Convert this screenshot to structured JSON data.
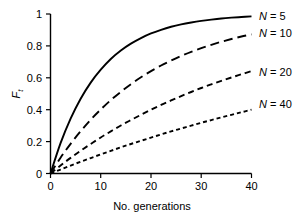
{
  "chart_data": {
    "type": "line",
    "title": "",
    "subtitle": "",
    "xlabel": "No. generations",
    "ylabel": "F",
    "ylabel_sub": "t",
    "ylabel_full": "F_t",
    "xlim": [
      0,
      40
    ],
    "ylim": [
      0,
      1
    ],
    "xticks": [
      0,
      10,
      20,
      30,
      40
    ],
    "xticklabels": [
      "0",
      "10",
      "20",
      "30",
      "40"
    ],
    "yticks": [
      0,
      0.2,
      0.4,
      0.6,
      0.8,
      1
    ],
    "yticklabels": [
      "0",
      "0.2",
      "0.4",
      "0.6",
      "0.8",
      "1"
    ],
    "grid": false,
    "legend_position": "right-inline-end-of-line",
    "formula": "F_t = 1 - (1 - 1/(2N))^t",
    "x": [
      0,
      2,
      4,
      6,
      8,
      10,
      12,
      14,
      16,
      18,
      20,
      22,
      24,
      26,
      28,
      30,
      32,
      34,
      36,
      38,
      40
    ],
    "series": [
      {
        "name": "N = 5",
        "N": 5,
        "label_prefix": "N",
        "label_eq": "=",
        "label_value": "5",
        "linestyle": "solid",
        "dasharray": "none",
        "color": "#000000",
        "values": [
          0,
          0.19,
          0.344,
          0.469,
          0.57,
          0.651,
          0.718,
          0.771,
          0.814,
          0.849,
          0.878,
          0.901,
          0.92,
          0.935,
          0.947,
          0.957,
          0.965,
          0.972,
          0.977,
          0.981,
          0.985
        ]
      },
      {
        "name": "N = 10",
        "N": 10,
        "label_prefix": "N",
        "label_eq": "=",
        "label_value": "10",
        "linestyle": "long-dash",
        "dasharray": "9,5",
        "color": "#000000",
        "values": [
          0,
          0.099,
          0.186,
          0.265,
          0.337,
          0.401,
          0.46,
          0.512,
          0.56,
          0.603,
          0.642,
          0.677,
          0.708,
          0.737,
          0.763,
          0.786,
          0.807,
          0.826,
          0.843,
          0.859,
          0.872
        ]
      },
      {
        "name": "N = 20",
        "N": 20,
        "label_prefix": "N",
        "label_eq": "=",
        "label_value": "20",
        "linestyle": "medium-dash",
        "dasharray": "6,4",
        "color": "#000000",
        "values": [
          0,
          0.05,
          0.098,
          0.143,
          0.185,
          0.226,
          0.264,
          0.301,
          0.335,
          0.368,
          0.4,
          0.43,
          0.458,
          0.485,
          0.511,
          0.536,
          0.559,
          0.581,
          0.602,
          0.622,
          0.642
        ]
      },
      {
        "name": "N = 40",
        "N": 40,
        "label_prefix": "N",
        "label_eq": "=",
        "label_value": "40",
        "linestyle": "short-dash",
        "dasharray": "4,3",
        "color": "#000000",
        "values": [
          0,
          0.025,
          0.05,
          0.074,
          0.097,
          0.12,
          0.142,
          0.164,
          0.185,
          0.205,
          0.225,
          0.245,
          0.264,
          0.282,
          0.3,
          0.318,
          0.335,
          0.352,
          0.368,
          0.384,
          0.4
        ]
      }
    ],
    "annotations": []
  },
  "legend": {
    "entries": [
      {
        "text": "N = 5",
        "prefix": "N",
        "eq": " = ",
        "value": "5"
      },
      {
        "text": "N = 10",
        "prefix": "N",
        "eq": " = ",
        "value": "10"
      },
      {
        "text": "N = 20",
        "prefix": "N",
        "eq": " = ",
        "value": "20"
      },
      {
        "text": "N = 40",
        "prefix": "N",
        "eq": " = ",
        "value": "40"
      }
    ]
  },
  "axes": {
    "x_title": "No. generations",
    "y_title": "F",
    "y_title_sub": "t",
    "x_tick_0": "0",
    "x_tick_1": "10",
    "x_tick_2": "20",
    "x_tick_3": "30",
    "x_tick_4": "40",
    "y_tick_0": "0",
    "y_tick_1": "0.2",
    "y_tick_2": "0.4",
    "y_tick_3": "0.6",
    "y_tick_4": "0.8",
    "y_tick_5": "1"
  },
  "colors": {
    "background": "#ffffff",
    "ink": "#000000"
  }
}
